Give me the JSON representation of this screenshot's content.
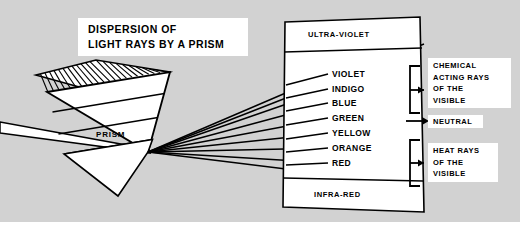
{
  "figure": {
    "title_lines": [
      "DISPERSION  OF",
      "LIGHT  RAYS  BY  A  PRISM"
    ],
    "background_color": "#d2d2d2",
    "ink_color": "#000000",
    "panel_color": "#ffffff"
  },
  "prism": {
    "label": "PRISM"
  },
  "spectrum": {
    "top_band": "ULTRA-VIOLET",
    "bottom_band": "INFRA-RED",
    "colors": [
      {
        "name": "VIOLET"
      },
      {
        "name": "INDIGO"
      },
      {
        "name": "BLUE"
      },
      {
        "name": "GREEN"
      },
      {
        "name": "YELLOW"
      },
      {
        "name": "ORANGE"
      },
      {
        "name": "RED"
      }
    ]
  },
  "annotations": {
    "chemical": [
      "CHEMICAL",
      "ACTING RAYS",
      "OF THE",
      "VISIBLE"
    ],
    "neutral": "NEUTRAL",
    "heat": [
      "HEAT RAYS",
      "OF THE",
      "VISIBLE"
    ]
  }
}
